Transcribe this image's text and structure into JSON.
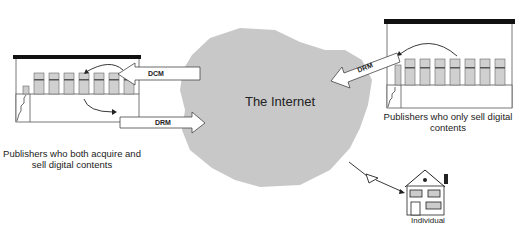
{
  "diagram": {
    "cloud": {
      "label": "The Internet",
      "fill": "#c8c8c8"
    },
    "publishers_left": {
      "label": "Publishers who both acquire and sell digital contents",
      "server_count": 7
    },
    "publishers_right": {
      "label": "Publishers who only sell digital contents",
      "server_count": 7
    },
    "individual": {
      "label": "Individual"
    },
    "arrows": {
      "dcm_in": {
        "label": "DCM"
      },
      "drm_out": {
        "label": "DRM"
      },
      "drm_right": {
        "label": "DRM"
      }
    }
  }
}
